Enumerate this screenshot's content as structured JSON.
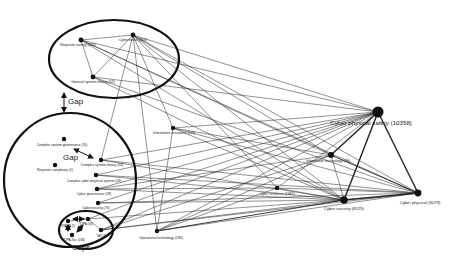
{
  "diagram": {
    "type": "network-graph",
    "colors": {
      "background": "#ffffff",
      "node": "#111111",
      "edge": "#222222",
      "ellipse": "#111111"
    },
    "nodes": [
      {
        "id": "cybernetics",
        "label": "Cybernetics (800)",
        "x": 133,
        "y": 35,
        "r": 2.4,
        "lx": 133,
        "ly": 41,
        "fs": 3.6,
        "anchor": "middle"
      },
      {
        "id": "requisite_variety",
        "label": "Requisite variety (245)",
        "x": 81,
        "y": 40,
        "r": 2.4,
        "lx": 78,
        "ly": 46,
        "fs": 3.6,
        "anchor": "middle"
      },
      {
        "id": "general_system_theory",
        "label": "General system theory (42)",
        "x": 93,
        "y": 77,
        "r": 2.4,
        "lx": 93,
        "ly": 83,
        "fs": 3.6,
        "anchor": "middle"
      },
      {
        "id": "information_assurance",
        "label": "Information assurance (119)",
        "x": 173,
        "y": 128,
        "r": 2.2,
        "lx": 174,
        "ly": 134,
        "fs": 3.4,
        "anchor": "middle"
      },
      {
        "id": "complex_system_governance",
        "label": "Complex system governance (16)",
        "x": 64,
        "y": 139,
        "r": 2.2,
        "lx": 62,
        "ly": 146,
        "fs": 3.4,
        "anchor": "middle"
      },
      {
        "id": "complex_system_theory",
        "label": "Complex system theory (24)",
        "x": 101,
        "y": 160,
        "r": 2.2,
        "lx": 102,
        "ly": 166,
        "fs": 3.4,
        "anchor": "middle"
      },
      {
        "id": "requisite_complexity",
        "label": "Requisite complexity (1)",
        "x": 55,
        "y": 165,
        "r": 2.2,
        "lx": 55,
        "ly": 171,
        "fs": 3.4,
        "anchor": "middle"
      },
      {
        "id": "complex_cyber_physical_system",
        "label": "Complex cyber physical system (16)",
        "x": 96,
        "y": 175,
        "r": 2.2,
        "lx": 94,
        "ly": 182,
        "fs": 3.4,
        "anchor": "middle"
      },
      {
        "id": "cyber_governance",
        "label": "Cyber governance (28)",
        "x": 97,
        "y": 189,
        "r": 2.2,
        "lx": 94,
        "ly": 195,
        "fs": 3.4,
        "anchor": "middle"
      },
      {
        "id": "cybersecurity",
        "label": "Cybersecurity (76)",
        "x": 98,
        "y": 203,
        "r": 2.2,
        "lx": 96,
        "ly": 209,
        "fs": 3.4,
        "anchor": "middle"
      },
      {
        "id": "cyber_physical_safety",
        "label": "Cyber physical safety (10358)",
        "x": 378,
        "y": 112,
        "r": 5.5,
        "lx": 371,
        "ly": 125,
        "fs": 6.2,
        "anchor": "middle"
      },
      {
        "id": "information_technology",
        "label": "Information technology (26)",
        "x": 331,
        "y": 155,
        "r": 3.0,
        "lx": 328,
        "ly": 162,
        "fs": 3.6,
        "anchor": "middle"
      },
      {
        "id": "cyber_resilience",
        "label": "Cyber resilience (1481)",
        "x": 277,
        "y": 188,
        "r": 2.2,
        "lx": 277,
        "ly": 195,
        "fs": 3.4,
        "anchor": "middle"
      },
      {
        "id": "cyber_security",
        "label": "Cyber security (8125)",
        "x": 344,
        "y": 200,
        "r": 3.8,
        "lx": 344,
        "ly": 210,
        "fs": 4.2,
        "anchor": "middle"
      },
      {
        "id": "cyber_physical",
        "label": "Cyber physical (6079)",
        "x": 418,
        "y": 193,
        "r": 3.4,
        "lx": 420,
        "ly": 204,
        "fs": 4.2,
        "anchor": "middle"
      },
      {
        "id": "operational_technology",
        "label": "Operational technology (186)",
        "x": 157,
        "y": 231,
        "r": 2.2,
        "lx": 161,
        "ly": 239,
        "fs": 3.4,
        "anchor": "middle"
      },
      {
        "id": "stamp",
        "label": "STAMP (5)",
        "x": 68,
        "y": 221,
        "r": 2.2,
        "lx": 68,
        "ly": 227,
        "fs": 3,
        "anchor": "middle"
      },
      {
        "id": "stpa",
        "label": "STPA (56)",
        "x": 88,
        "y": 219,
        "r": 2.2,
        "lx": 86,
        "ly": 225,
        "fs": 3,
        "anchor": "middle"
      },
      {
        "id": "stpa_sec",
        "label": "STPA-Sec (186)",
        "x": 72,
        "y": 235,
        "r": 2.2,
        "lx": 74,
        "ly": 241,
        "fs": 3,
        "anchor": "middle"
      },
      {
        "id": "tas",
        "label": "TAS (307)",
        "x": 101,
        "y": 230,
        "r": 2.2,
        "lx": 103,
        "ly": 237,
        "fs": 3,
        "anchor": "middle"
      }
    ],
    "edges": [
      {
        "from": "requisite_variety",
        "to": "cybernetics",
        "w": 0.5
      },
      {
        "from": "requisite_variety",
        "to": "general_system_theory",
        "w": 0.5
      },
      {
        "from": "cybernetics",
        "to": "general_system_theory",
        "w": 0.5
      },
      {
        "from": "cybernetics",
        "to": "complex_system_theory",
        "w": 0.5
      },
      {
        "from": "cybernetics",
        "to": "operational_technology",
        "w": 0.5
      },
      {
        "from": "cybernetics",
        "to": "information_assurance",
        "w": 0.5
      },
      {
        "from": "cybernetics",
        "to": "cyber_physical_safety",
        "w": 0.5
      },
      {
        "from": "cybernetics",
        "to": "cyber_security",
        "w": 0.5
      },
      {
        "from": "cybernetics",
        "to": "cyber_physical",
        "w": 0.5
      },
      {
        "from": "cybernetics",
        "to": "information_technology",
        "w": 0.5
      },
      {
        "from": "cybernetics",
        "to": "cyber_resilience",
        "w": 0.5
      },
      {
        "from": "requisite_variety",
        "to": "cyber_physical_safety",
        "w": 0.5
      },
      {
        "from": "requisite_variety",
        "to": "cyber_security",
        "w": 0.5
      },
      {
        "from": "requisite_variety",
        "to": "cyber_physical",
        "w": 0.5
      },
      {
        "from": "requisite_variety",
        "to": "information_technology",
        "w": 0.5
      },
      {
        "from": "general_system_theory",
        "to": "cyber_physical_safety",
        "w": 0.5
      },
      {
        "from": "general_system_theory",
        "to": "cyber_security",
        "w": 0.5
      },
      {
        "from": "general_system_theory",
        "to": "cyber_physical",
        "w": 0.5
      },
      {
        "from": "information_assurance",
        "to": "cyber_physical_safety",
        "w": 0.5
      },
      {
        "from": "information_assurance",
        "to": "cyber_security",
        "w": 0.5
      },
      {
        "from": "information_assurance",
        "to": "cyber_physical",
        "w": 0.5
      },
      {
        "from": "information_assurance",
        "to": "operational_technology",
        "w": 0.5
      },
      {
        "from": "information_assurance",
        "to": "information_technology",
        "w": 0.5
      },
      {
        "from": "complex_system_theory",
        "to": "cyber_physical_safety",
        "w": 0.5
      },
      {
        "from": "complex_system_theory",
        "to": "cyber_physical",
        "w": 0.5
      },
      {
        "from": "complex_system_theory",
        "to": "cyber_security",
        "w": 0.5
      },
      {
        "from": "complex_cyber_physical_system",
        "to": "cyber_physical_safety",
        "w": 0.5
      },
      {
        "from": "complex_cyber_physical_system",
        "to": "cyber_physical",
        "w": 0.5
      },
      {
        "from": "complex_cyber_physical_system",
        "to": "cyber_security",
        "w": 0.5
      },
      {
        "from": "cyber_governance",
        "to": "cyber_physical_safety",
        "w": 0.5
      },
      {
        "from": "cyber_governance",
        "to": "cyber_security",
        "w": 0.5
      },
      {
        "from": "cyber_governance",
        "to": "cyber_resilience",
        "w": 0.5
      },
      {
        "from": "cyber_governance",
        "to": "information_technology",
        "w": 0.5
      },
      {
        "from": "cybersecurity",
        "to": "cyber_physical_safety",
        "w": 0.5
      },
      {
        "from": "cybersecurity",
        "to": "cyber_security",
        "w": 0.5
      },
      {
        "from": "cybersecurity",
        "to": "cyber_physical",
        "w": 0.5
      },
      {
        "from": "tas",
        "to": "cyber_physical_safety",
        "w": 0.5
      },
      {
        "from": "tas",
        "to": "cyber_security",
        "w": 0.5
      },
      {
        "from": "tas",
        "to": "cyber_physical",
        "w": 0.5
      },
      {
        "from": "tas",
        "to": "information_technology",
        "w": 0.5
      },
      {
        "from": "stpa",
        "to": "cyber_physical_safety",
        "w": 0.5
      },
      {
        "from": "stpa",
        "to": "cyber_security",
        "w": 0.5
      },
      {
        "from": "operational_technology",
        "to": "cyber_physical_safety",
        "w": 0.5
      },
      {
        "from": "operational_technology",
        "to": "cyber_security",
        "w": 0.9
      },
      {
        "from": "operational_technology",
        "to": "cyber_physical",
        "w": 0.5
      },
      {
        "from": "operational_technology",
        "to": "information_technology",
        "w": 0.5
      },
      {
        "from": "operational_technology",
        "to": "cyber_resilience",
        "w": 0.5
      },
      {
        "from": "cyber_resilience",
        "to": "cyber_physical_safety",
        "w": 0.5
      },
      {
        "from": "cyber_resilience",
        "to": "cyber_security",
        "w": 0.5
      },
      {
        "from": "cyber_resilience",
        "to": "cyber_physical",
        "w": 0.5
      },
      {
        "from": "information_technology",
        "to": "cyber_security",
        "w": 0.5
      },
      {
        "from": "information_technology",
        "to": "cyber_physical",
        "w": 0.9
      },
      {
        "from": "cyber_physical_safety",
        "to": "information_technology",
        "w": 1.4
      },
      {
        "from": "cyber_physical_safety",
        "to": "cyber_security",
        "w": 1.4
      },
      {
        "from": "cyber_physical_safety",
        "to": "cyber_physical",
        "w": 1.4
      },
      {
        "from": "cyber_security",
        "to": "cyber_physical",
        "w": 1.6
      },
      {
        "from": "stamp",
        "to": "stpa",
        "w": 0.5
      },
      {
        "from": "stpa",
        "to": "tas",
        "w": 0.5
      }
    ],
    "ellipses": [
      {
        "name": "top-ellipse",
        "cx": 114,
        "cy": 59,
        "rx": 65,
        "ry": 39,
        "w": 2.2
      },
      {
        "name": "left-ellipse",
        "cx": 70,
        "cy": 180,
        "rx": 66,
        "ry": 67,
        "w": 2.2
      },
      {
        "name": "gaps-ellipse",
        "cx": 86,
        "cy": 230,
        "rx": 27,
        "ry": 19,
        "w": 2.2
      }
    ],
    "annotations": [
      {
        "name": "gap-label-top",
        "text": "Gap",
        "x": 68,
        "y": 104,
        "fs": 8
      },
      {
        "name": "gap-label-mid",
        "text": "Gap",
        "x": 63,
        "y": 160,
        "fs": 8
      },
      {
        "name": "gaps-label",
        "text": "Gaps",
        "x": 72,
        "y": 250,
        "fs": 7.5
      }
    ],
    "arrows": [
      {
        "name": "gap-arrow-top",
        "x1": 64,
        "y1": 93,
        "x2": 64,
        "y2": 112
      },
      {
        "name": "gap-arrow-mid",
        "x1": 74,
        "y1": 149,
        "x2": 93,
        "y2": 158
      },
      {
        "name": "gaps-arrow-1",
        "x1": 73,
        "y1": 219,
        "x2": 84,
        "y2": 219
      },
      {
        "name": "gaps-arrow-2",
        "x1": 77,
        "y1": 232,
        "x2": 83,
        "y2": 225
      },
      {
        "name": "gaps-arrow-3",
        "x1": 68,
        "y1": 225,
        "x2": 68,
        "y2": 231
      }
    ]
  }
}
